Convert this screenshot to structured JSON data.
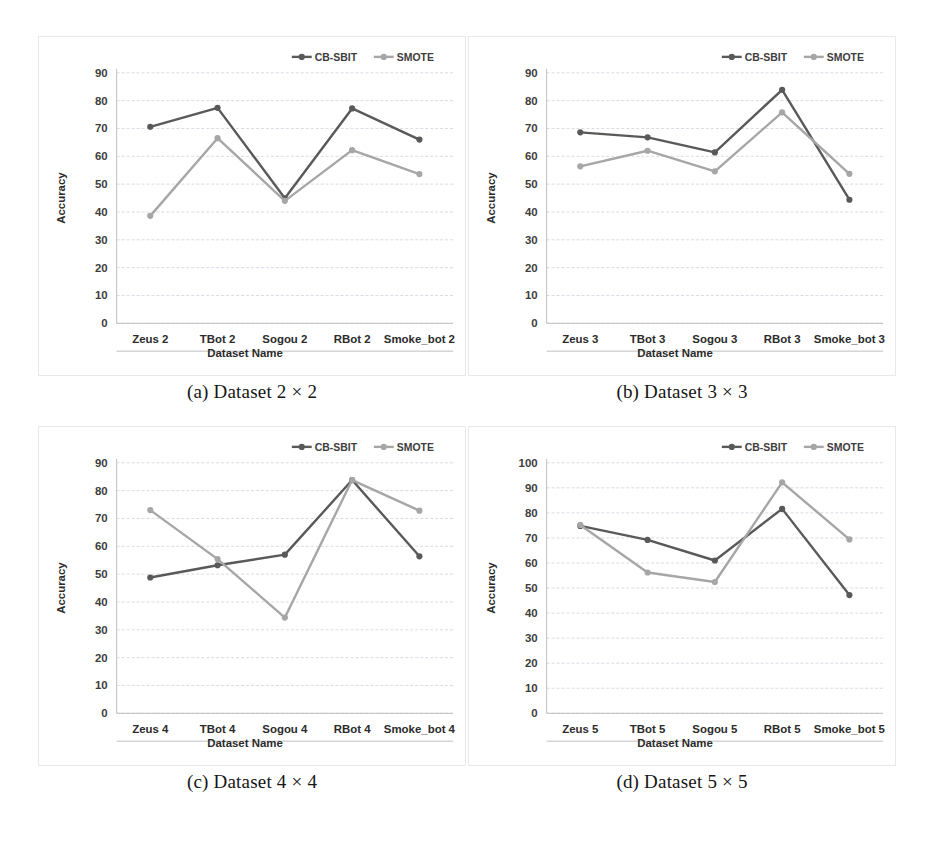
{
  "figure": {
    "panels": [
      {
        "id": "a",
        "caption": "(a) Dataset 2 × 2",
        "chart_data": {
          "type": "line",
          "title": "",
          "xlabel": "Dataset Name",
          "ylabel": "Accuracy",
          "categories": [
            "Zeus 2",
            "TBot 2",
            "Sogou 2",
            "RBot 2",
            "Smoke_bot 2"
          ],
          "yticks": [
            0,
            10,
            20,
            30,
            40,
            50,
            60,
            70,
            80,
            90
          ],
          "ylim": [
            0,
            90
          ],
          "grid": true,
          "legend_position": "top-right",
          "series": [
            {
              "name": "CB-SBIT",
              "color": "#595959",
              "values": [
                70.6,
                77.4,
                44.9,
                77.2,
                66.0
              ]
            },
            {
              "name": "SMOTE",
              "color": "#a6a6a6",
              "values": [
                38.6,
                66.5,
                44.0,
                62.2,
                53.6
              ]
            }
          ]
        }
      },
      {
        "id": "b",
        "caption": "(b) Dataset 3 × 3",
        "chart_data": {
          "type": "line",
          "title": "",
          "xlabel": "Dataset Name",
          "ylabel": "Accuracy",
          "categories": [
            "Zeus 3",
            "TBot 3",
            "Sogou 3",
            "RBot 3",
            "Smoke_bot 3"
          ],
          "yticks": [
            0,
            10,
            20,
            30,
            40,
            50,
            60,
            70,
            80,
            90
          ],
          "ylim": [
            0,
            90
          ],
          "grid": true,
          "legend_position": "top-right",
          "series": [
            {
              "name": "CB-SBIT",
              "color": "#595959",
              "values": [
                68.6,
                66.8,
                61.4,
                83.9,
                44.4
              ]
            },
            {
              "name": "SMOTE",
              "color": "#a6a6a6",
              "values": [
                56.4,
                62.0,
                54.6,
                75.8,
                53.7
              ]
            }
          ]
        }
      },
      {
        "id": "c",
        "caption": "(c) Dataset 4 × 4",
        "chart_data": {
          "type": "line",
          "title": "",
          "xlabel": "Dataset Name",
          "ylabel": "Accuracy",
          "categories": [
            "Zeus 4",
            "TBot 4",
            "Sogou 4",
            "RBot 4",
            "Smoke_bot 4"
          ],
          "yticks": [
            0,
            10,
            20,
            30,
            40,
            50,
            60,
            70,
            80,
            90
          ],
          "ylim": [
            0,
            90
          ],
          "grid": true,
          "legend_position": "top-right",
          "series": [
            {
              "name": "CB-SBIT",
              "color": "#595959",
              "values": [
                48.8,
                53.2,
                57.0,
                83.8,
                56.4
              ]
            },
            {
              "name": "SMOTE",
              "color": "#a6a6a6",
              "values": [
                73.0,
                55.4,
                34.4,
                83.8,
                72.8
              ]
            }
          ]
        }
      },
      {
        "id": "d",
        "caption": "(d) Dataset 5 × 5",
        "chart_data": {
          "type": "line",
          "title": "",
          "xlabel": "Dataset Name",
          "ylabel": "Accuracy",
          "categories": [
            "Zeus 5",
            "TBot 5",
            "Sogou 5",
            "RBot 5",
            "Smoke_bot 5"
          ],
          "yticks": [
            0,
            10,
            20,
            30,
            40,
            50,
            60,
            70,
            80,
            90,
            100
          ],
          "ylim": [
            0,
            100
          ],
          "grid": true,
          "legend_position": "top-right",
          "series": [
            {
              "name": "CB-SBIT",
              "color": "#595959",
              "values": [
                74.8,
                69.2,
                61.0,
                81.6,
                47.2
              ]
            },
            {
              "name": "SMOTE",
              "color": "#a6a6a6",
              "values": [
                75.2,
                56.2,
                52.4,
                92.2,
                69.4
              ]
            }
          ]
        }
      }
    ]
  }
}
